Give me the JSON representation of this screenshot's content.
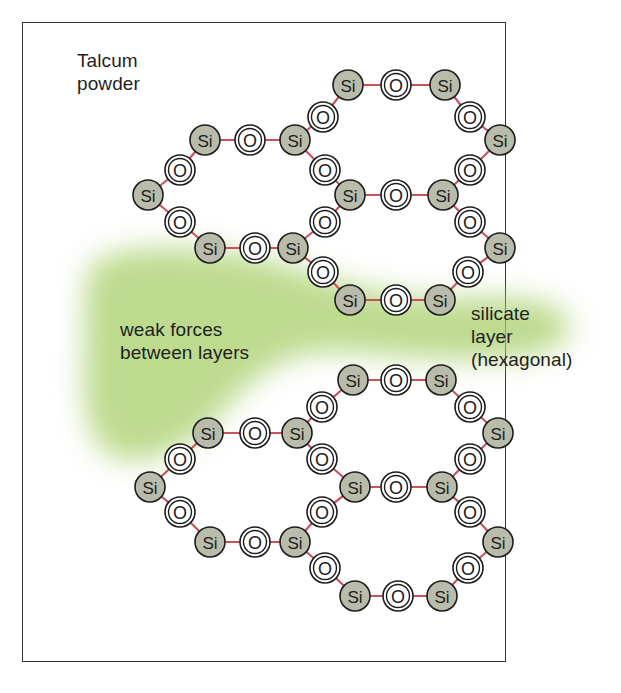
{
  "title": {
    "line1": "Talcum",
    "line2": "powder"
  },
  "labels": {
    "weak_forces_line1": "weak forces",
    "weak_forces_line2": "between layers",
    "silicate_line1": "silicate",
    "silicate_line2": "layer",
    "silicate_line3": "(hexagonal)"
  },
  "atoms": {
    "silicon": "Si",
    "oxygen": "O"
  },
  "colors": {
    "silicon_fill": "#b9bcaa",
    "oxygen_fill": "#ffffff",
    "bond": "#c9525f",
    "wash": "#a8cf6a",
    "frame": "#333333"
  },
  "structure": {
    "layers": [
      {
        "name": "upper-silicate-layer",
        "atoms": [
          [
            "Si",
            348,
            85
          ],
          [
            "O",
            396,
            85
          ],
          [
            "Si",
            445,
            85
          ],
          [
            "O",
            323,
            117
          ],
          [
            "O",
            470,
            117
          ],
          [
            "Si",
            205,
            140
          ],
          [
            "O",
            250,
            140
          ],
          [
            "Si",
            295,
            140
          ],
          [
            "Si",
            500,
            140
          ],
          [
            "O",
            180,
            170
          ],
          [
            "O",
            325,
            170
          ],
          [
            "O",
            470,
            170
          ],
          [
            "Si",
            148,
            195
          ],
          [
            "Si",
            350,
            195
          ],
          [
            "O",
            396,
            195
          ],
          [
            "Si",
            443,
            195
          ],
          [
            "O",
            180,
            222
          ],
          [
            "O",
            325,
            222
          ],
          [
            "O",
            470,
            222
          ],
          [
            "Si",
            210,
            248
          ],
          [
            "O",
            255,
            248
          ],
          [
            "Si",
            293,
            248
          ],
          [
            "Si",
            500,
            248
          ],
          [
            "O",
            323,
            272
          ],
          [
            "O",
            468,
            272
          ],
          [
            "Si",
            350,
            300
          ],
          [
            "O",
            396,
            300
          ],
          [
            "Si",
            440,
            300
          ]
        ]
      },
      {
        "name": "lower-silicate-layer",
        "atoms": [
          [
            "Si",
            353,
            380
          ],
          [
            "O",
            396,
            380
          ],
          [
            "Si",
            441,
            380
          ],
          [
            "O",
            322,
            407
          ],
          [
            "O",
            470,
            407
          ],
          [
            "Si",
            208,
            433
          ],
          [
            "O",
            255,
            433
          ],
          [
            "Si",
            297,
            433
          ],
          [
            "Si",
            498,
            433
          ],
          [
            "O",
            180,
            459
          ],
          [
            "O",
            322,
            459
          ],
          [
            "O",
            470,
            459
          ],
          [
            "Si",
            150,
            487
          ],
          [
            "Si",
            355,
            487
          ],
          [
            "O",
            396,
            487
          ],
          [
            "Si",
            442,
            487
          ],
          [
            "O",
            180,
            512
          ],
          [
            "O",
            322,
            512
          ],
          [
            "O",
            470,
            512
          ],
          [
            "Si",
            210,
            542
          ],
          [
            "O",
            255,
            542
          ],
          [
            "Si",
            295,
            542
          ],
          [
            "Si",
            498,
            542
          ],
          [
            "O",
            325,
            568
          ],
          [
            "O",
            468,
            568
          ],
          [
            "Si",
            355,
            596
          ],
          [
            "O",
            398,
            596
          ],
          [
            "Si",
            442,
            596
          ]
        ]
      }
    ]
  }
}
